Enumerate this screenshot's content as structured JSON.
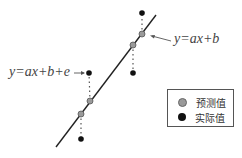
{
  "diagram": {
    "line_label": "y=ax+b",
    "actual_label": "y=ax+b+e",
    "line": {
      "x1": 56,
      "y1": 147,
      "x2": 156,
      "y2": 15
    },
    "pairs": [
      {
        "predicted": {
          "x": 142,
          "y": 34
        },
        "actual": {
          "x": 142,
          "y": 13
        }
      },
      {
        "predicted": {
          "x": 133,
          "y": 45
        },
        "actual": {
          "x": 133,
          "y": 73
        }
      },
      {
        "predicted": {
          "x": 90,
          "y": 101
        },
        "actual": {
          "x": 89,
          "y": 73
        }
      },
      {
        "predicted": {
          "x": 81,
          "y": 114
        },
        "actual": {
          "x": 81,
          "y": 139
        }
      }
    ]
  },
  "legend": {
    "items": [
      {
        "label": "预测值",
        "color": "#9a9a9a"
      },
      {
        "label": "实际值",
        "color": "#111111"
      }
    ]
  },
  "colors": {
    "line": "#222222",
    "predicted": "#9a9a9a",
    "actual": "#111111",
    "residual": "#555555"
  }
}
